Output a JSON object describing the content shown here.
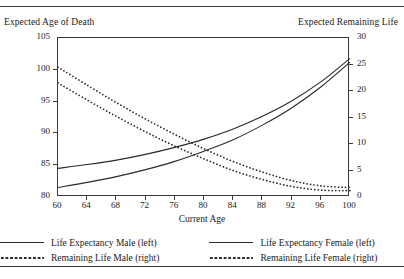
{
  "header": {
    "left_axis_title": "Expected Age of Death",
    "right_axis_title": "Expected Remaining Life"
  },
  "chart_data": {
    "type": "line",
    "title": "",
    "xlabel": "Current Age",
    "ylabel": "Expected Age of Death",
    "y2label": "Expected Remaining Life",
    "xlim": [
      60,
      100
    ],
    "ylim": [
      80,
      105
    ],
    "y2lim": [
      0,
      30
    ],
    "xticks": [
      60,
      64,
      68,
      72,
      76,
      80,
      84,
      88,
      92,
      96,
      100
    ],
    "yticks": [
      80,
      85,
      90,
      95,
      100,
      105
    ],
    "y2ticks": [
      0,
      5,
      10,
      15,
      20,
      25,
      30
    ],
    "grid": false,
    "legend_position": "bottom",
    "x": [
      60,
      64,
      68,
      72,
      76,
      80,
      84,
      88,
      92,
      96,
      100
    ],
    "series": [
      {
        "name": "Life Expectancy Male (left)",
        "axis": "left",
        "style": "solid",
        "color": "#2a2a2a",
        "values": [
          81.5,
          82.3,
          83.2,
          84.3,
          85.6,
          87.2,
          89.0,
          91.3,
          94.0,
          97.3,
          101.2
        ]
      },
      {
        "name": "Life Expectancy Female (left)",
        "axis": "left",
        "style": "solid",
        "color": "#2a2a2a",
        "values": [
          84.5,
          85.1,
          85.8,
          86.7,
          87.8,
          89.1,
          90.7,
          92.7,
          95.1,
          98.1,
          101.8
        ]
      },
      {
        "name": "Remaining Life Male (right)",
        "axis": "right",
        "style": "dotted",
        "color": "#2a2a2a",
        "values": [
          21.5,
          18.3,
          15.2,
          12.3,
          9.6,
          7.2,
          5.0,
          3.3,
          2.0,
          1.3,
          1.2
        ]
      },
      {
        "name": "Remaining Life Female (right)",
        "axis": "right",
        "style": "dotted",
        "color": "#2a2a2a",
        "values": [
          24.5,
          21.1,
          17.8,
          14.7,
          11.8,
          9.1,
          6.7,
          4.7,
          3.1,
          2.1,
          1.8
        ]
      }
    ]
  },
  "legend": {
    "items": [
      {
        "label": "Life Expectancy Male (left)",
        "style": "solid"
      },
      {
        "label": "Life Expectancy Female (left)",
        "style": "solid"
      },
      {
        "label": "Remaining Life Male (right)",
        "style": "dotted"
      },
      {
        "label": "Remaining Life Female (right)",
        "style": "dotted"
      }
    ]
  }
}
